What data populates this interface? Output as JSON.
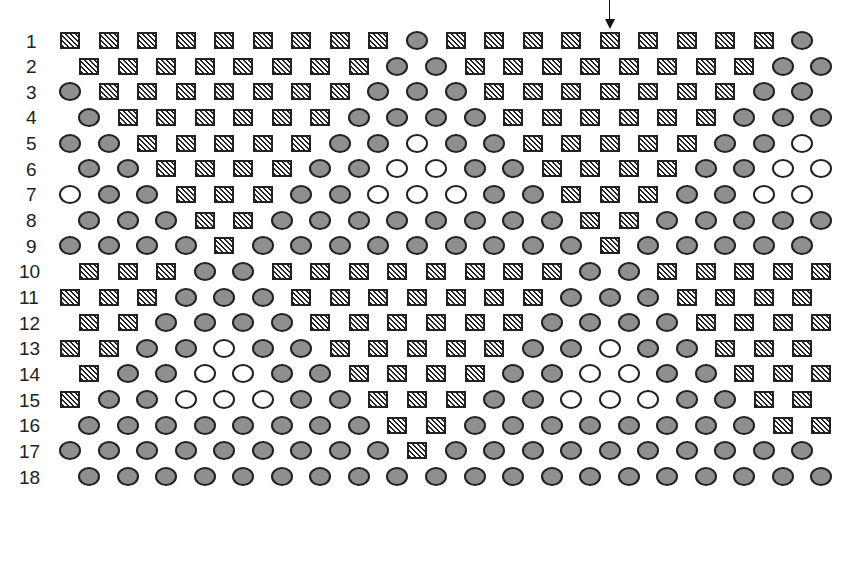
{
  "diagram": {
    "legend_symbols": {
      "S": "hatched-square",
      "G": "gray-filled-circle",
      "W": "white-open-circle"
    },
    "colors": {
      "outline": "#222222",
      "gray_fill": "#8f8f8f",
      "white_fill": "#ffffff"
    },
    "marker": {
      "type": "down-arrow",
      "row": 1,
      "column": 15
    },
    "rows": [
      {
        "label": "1",
        "cells": "S S S S S S S S S G S S S S S S S S S G"
      },
      {
        "label": "2",
        "cells": "S S S S S S S S G G S S S S S S S S G G"
      },
      {
        "label": "3",
        "cells": "G S S S S S S S G G G S S S S S S S G G"
      },
      {
        "label": "4",
        "cells": "G S S S S S S G G G G S S S S S S G G G"
      },
      {
        "label": "5",
        "cells": "G G S S S S S G G W G G S S S S S G G W"
      },
      {
        "label": "6",
        "cells": "G G S S S S G G W W G G S S S S G G W W"
      },
      {
        "label": "7",
        "cells": "W G G S S S G G W W W G G S S S G G W W"
      },
      {
        "label": "8",
        "cells": "G G G S S G G G G G G G G S S G G G G G"
      },
      {
        "label": "9",
        "cells": "G G G G S G G G G G G G G G S G G G G G"
      },
      {
        "label": "10",
        "cells": "S S S G G S S S S S S S S G G S S S S S"
      },
      {
        "label": "11",
        "cells": "S S S G G G S S S S S S S G G G S S S S"
      },
      {
        "label": "12",
        "cells": "S S G G G G S S S S S S G G G G S S S S"
      },
      {
        "label": "13",
        "cells": "S S G G W G G S S S S S G G W G G S S S"
      },
      {
        "label": "14",
        "cells": "S G G W W G G S S S S G G W W G G S S S"
      },
      {
        "label": "15",
        "cells": "S G G W W W G G S S S G G W W W G G S S"
      },
      {
        "label": "16",
        "cells": "G G G G G G G G S S G G G G G G G G S S"
      },
      {
        "label": "17",
        "cells": "G G G G G G G G G S G G G G G G G G G G"
      },
      {
        "label": "18",
        "cells": "G G G G G G G G G G G G G G G G G G G G"
      }
    ]
  }
}
